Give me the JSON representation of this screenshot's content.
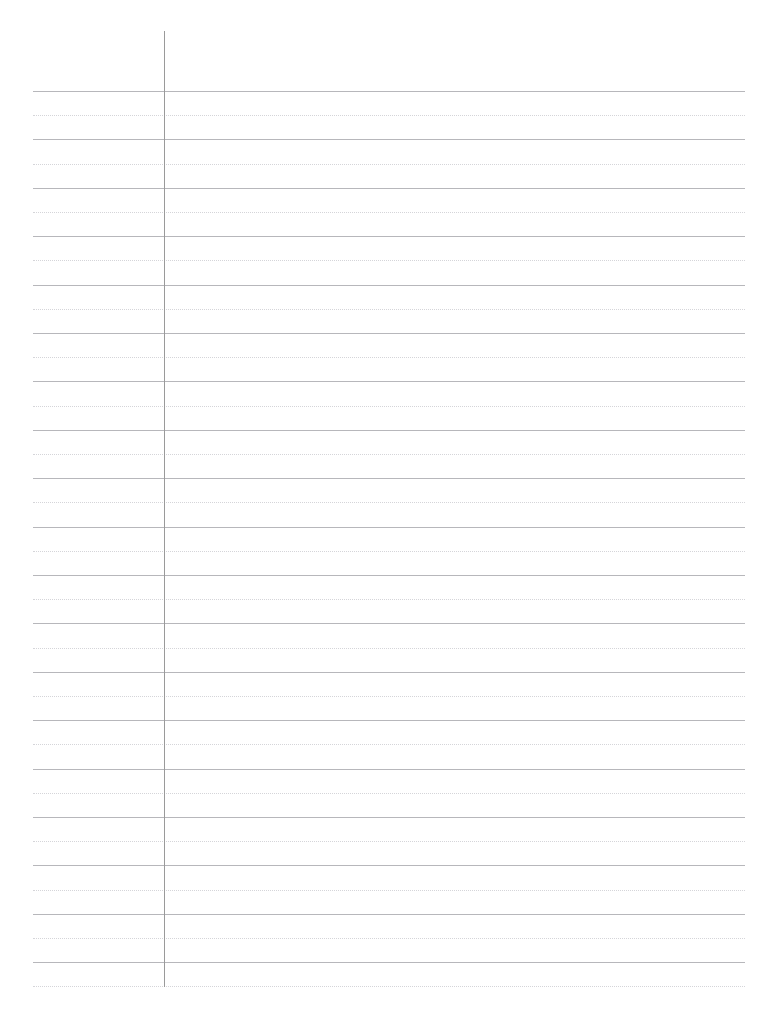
{
  "page": {
    "kind": "ruled-notebook-paper",
    "width": 771,
    "height": 1018,
    "background_color": "#ffffff",
    "content_text": "",
    "title": ""
  },
  "margin_rule": {
    "name": "vertical-margin-line",
    "x": 164,
    "y_start": 31,
    "y_end": 987,
    "thickness": 1,
    "color": "#9a9a9a",
    "style": "solid"
  },
  "rules": {
    "solid": {
      "color": "#b7b7bb",
      "thickness": 1,
      "style": "solid",
      "x_start": 33,
      "x_end": 745,
      "first_y": 91,
      "spacing": 48.4,
      "count": 19,
      "y_positions": [
        91,
        139.4,
        187.8,
        236.2,
        284.6,
        333,
        381.4,
        429.8,
        478.2,
        526.6,
        575,
        623.4,
        671.8,
        720.2,
        768.6,
        817,
        865.4,
        913.8,
        962.2
      ]
    },
    "dotted": {
      "color": "#d5d5d9",
      "thickness": 1,
      "style": "dotted",
      "x_start": 33,
      "x_end": 745,
      "first_y": 115.2,
      "spacing": 48.4,
      "count": 19,
      "y_positions": [
        115.2,
        163.6,
        212,
        260.4,
        308.8,
        357.2,
        405.6,
        454,
        502.4,
        550.8,
        599.2,
        647.6,
        696,
        744.4,
        792.8,
        841.2,
        889.6,
        938,
        986.4
      ]
    }
  }
}
